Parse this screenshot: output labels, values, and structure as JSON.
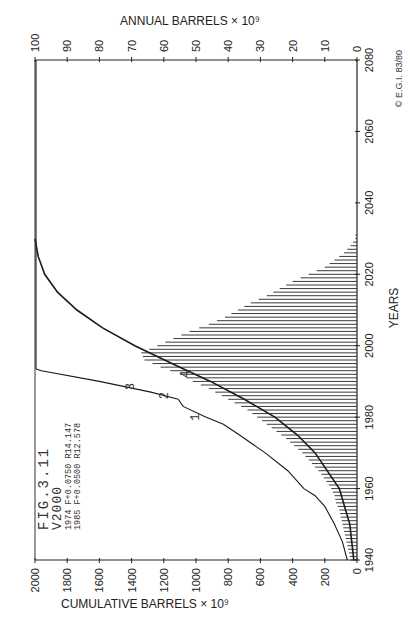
{
  "chart_data": {
    "type": "line",
    "orientation": "rotated-90-ccw",
    "title": "FIG.3.11",
    "subtitle": "V2000",
    "annotations": [
      "FIG.3.11",
      "V2000",
      "1974 F+0.0750 R14.147",
      "1985 F+0.0500 R12.578"
    ],
    "copyright": "© E.G.I. 83/80",
    "xlabel": "YEARS",
    "x_ticks": [
      1940,
      1960,
      1980,
      2000,
      2020,
      2040,
      2060,
      2080
    ],
    "xlim": [
      1940,
      2080
    ],
    "y_left_label": "CUMULATIVE BARRELS × 10⁹",
    "y_left_ticks": [
      0,
      200,
      400,
      600,
      800,
      1000,
      1200,
      1400,
      1600,
      1800,
      2000
    ],
    "y_left_lim": [
      0,
      2000
    ],
    "y_right_label": "ANNUAL BARRELS × 10⁹",
    "y_right_ticks": [
      0,
      10,
      20,
      30,
      40,
      50,
      60,
      70,
      80,
      90,
      100
    ],
    "y_right_lim": [
      0,
      100
    ],
    "grid": false,
    "series": [
      {
        "name": "Annual production (bars)",
        "type": "bar",
        "axis": "annual",
        "x": [
          1940,
          1942,
          1944,
          1946,
          1948,
          1950,
          1952,
          1954,
          1956,
          1958,
          1960,
          1962,
          1964,
          1966,
          1968,
          1970,
          1972,
          1974,
          1976,
          1978,
          1980,
          1982,
          1984,
          1986,
          1988,
          1990,
          1992,
          1994,
          1996,
          1998,
          2000,
          2002,
          2004,
          2006,
          2008,
          2010,
          2012,
          2014,
          2016,
          2018,
          2020,
          2022,
          2024,
          2026,
          2028,
          2030
        ],
        "values": [
          2,
          2.5,
          3,
          3.5,
          4,
          4.5,
          5,
          5.5,
          6.5,
          7,
          8,
          9.5,
          11,
          13,
          15,
          17,
          19.5,
          22,
          25,
          28,
          31,
          34,
          38,
          42,
          46,
          51,
          55,
          61,
          66,
          67,
          62,
          57,
          52,
          46,
          41,
          37,
          33,
          28,
          24,
          20,
          15,
          10,
          7,
          4,
          2,
          0.5
        ]
      },
      {
        "name": "Curve 1 (historical cumulative)",
        "axis": "cumulative",
        "x": [
          1940,
          1945,
          1950,
          1955,
          1958,
          1960,
          1965,
          1970,
          1975,
          1978,
          1980
        ],
        "values": [
          60,
          90,
          140,
          200,
          260,
          330,
          430,
          570,
          730,
          830,
          940
        ]
      },
      {
        "name": "Curve 2 (1974 F+0.0750 R14.147)",
        "axis": "cumulative",
        "x": [
          1980,
          1983,
          1985
        ],
        "values": [
          940,
          1080,
          1110
        ]
      },
      {
        "name": "Curve 3 (1985 F+0.0500 R12.578)",
        "axis": "cumulative",
        "x": [
          1985,
          1987,
          1990,
          1993
        ],
        "values": [
          1110,
          1280,
          1600,
          1960
        ]
      },
      {
        "name": "Curve 4 (logistic cumulative)",
        "axis": "cumulative",
        "x": [
          1940,
          1950,
          1960,
          1970,
          1975,
          1980,
          1985,
          1990,
          1995,
          2000,
          2005,
          2010,
          2015,
          2020,
          2025,
          2030
        ],
        "values": [
          20,
          45,
          110,
          260,
          370,
          510,
          700,
          910,
          1150,
          1380,
          1580,
          1740,
          1860,
          1940,
          1980,
          2000
        ]
      }
    ],
    "curve_labels": [
      "1",
      "2",
      "3",
      "4"
    ]
  }
}
